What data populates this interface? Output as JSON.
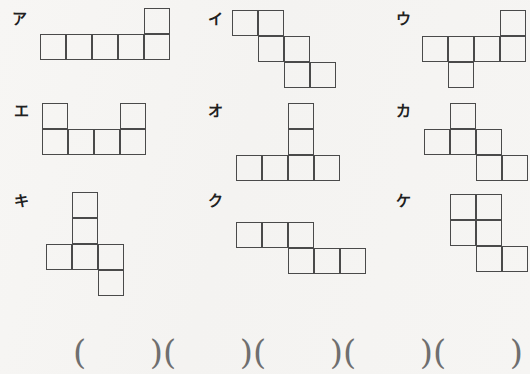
{
  "page": {
    "background_color": "#f6f5f3",
    "ink_color": "#4a4a4a",
    "label_color": "#202020",
    "paren_color": "#6f6f6f",
    "cell_size": 26
  },
  "shapes": [
    {
      "id": "shape-a",
      "label": "ア",
      "label_x": 12,
      "label_y": 12,
      "net_x": 40,
      "net_y": 8,
      "cells": [
        {
          "col": 4,
          "row": 0
        },
        {
          "col": 0,
          "row": 1
        },
        {
          "col": 1,
          "row": 1
        },
        {
          "col": 2,
          "row": 1
        },
        {
          "col": 3,
          "row": 1
        },
        {
          "col": 4,
          "row": 1
        }
      ]
    },
    {
      "id": "shape-i",
      "label": "イ",
      "label_x": 208,
      "label_y": 12,
      "net_x": 232,
      "net_y": 10,
      "cells": [
        {
          "col": 0,
          "row": 0
        },
        {
          "col": 1,
          "row": 0
        },
        {
          "col": 1,
          "row": 1
        },
        {
          "col": 2,
          "row": 1
        },
        {
          "col": 2,
          "row": 2
        },
        {
          "col": 3,
          "row": 2
        }
      ]
    },
    {
      "id": "shape-u",
      "label": "ウ",
      "label_x": 396,
      "label_y": 12,
      "net_x": 422,
      "net_y": 10,
      "cells": [
        {
          "col": 3,
          "row": 0
        },
        {
          "col": 0,
          "row": 1
        },
        {
          "col": 1,
          "row": 1
        },
        {
          "col": 2,
          "row": 1
        },
        {
          "col": 3,
          "row": 1
        },
        {
          "col": 1,
          "row": 2
        }
      ]
    },
    {
      "id": "shape-e",
      "label": "エ",
      "label_x": 14,
      "label_y": 104,
      "net_x": 42,
      "net_y": 103,
      "cells": [
        {
          "col": 0,
          "row": 0
        },
        {
          "col": 3,
          "row": 0
        },
        {
          "col": 0,
          "row": 1
        },
        {
          "col": 1,
          "row": 1
        },
        {
          "col": 2,
          "row": 1
        },
        {
          "col": 3,
          "row": 1
        }
      ]
    },
    {
      "id": "shape-o",
      "label": "オ",
      "label_x": 208,
      "label_y": 104,
      "net_x": 236,
      "net_y": 103,
      "cells": [
        {
          "col": 2,
          "row": 0
        },
        {
          "col": 2,
          "row": 1
        },
        {
          "col": 0,
          "row": 2
        },
        {
          "col": 1,
          "row": 2
        },
        {
          "col": 2,
          "row": 2
        },
        {
          "col": 3,
          "row": 2
        }
      ]
    },
    {
      "id": "shape-ka",
      "label": "カ",
      "label_x": 396,
      "label_y": 104,
      "net_x": 424,
      "net_y": 103,
      "cells": [
        {
          "col": 1,
          "row": 0
        },
        {
          "col": 0,
          "row": 1
        },
        {
          "col": 1,
          "row": 1
        },
        {
          "col": 2,
          "row": 1
        },
        {
          "col": 2,
          "row": 2
        },
        {
          "col": 3,
          "row": 2
        }
      ]
    },
    {
      "id": "shape-ki",
      "label": "キ",
      "label_x": 14,
      "label_y": 194,
      "net_x": 46,
      "net_y": 192,
      "cells": [
        {
          "col": 1,
          "row": 0
        },
        {
          "col": 1,
          "row": 1
        },
        {
          "col": 0,
          "row": 2
        },
        {
          "col": 1,
          "row": 2
        },
        {
          "col": 2,
          "row": 2
        },
        {
          "col": 2,
          "row": 3
        }
      ]
    },
    {
      "id": "shape-ku",
      "label": "ク",
      "label_x": 208,
      "label_y": 194,
      "net_x": 236,
      "net_y": 222,
      "cells": [
        {
          "col": 0,
          "row": 0
        },
        {
          "col": 1,
          "row": 0
        },
        {
          "col": 2,
          "row": 0
        },
        {
          "col": 2,
          "row": 1
        },
        {
          "col": 3,
          "row": 1
        },
        {
          "col": 4,
          "row": 1
        }
      ]
    },
    {
      "id": "shape-ke",
      "label": "ケ",
      "label_x": 396,
      "label_y": 194,
      "net_x": 450,
      "net_y": 194,
      "cells": [
        {
          "col": 0,
          "row": 0
        },
        {
          "col": 1,
          "row": 0
        },
        {
          "col": 0,
          "row": 1
        },
        {
          "col": 1,
          "row": 1
        },
        {
          "col": 1,
          "row": 2
        },
        {
          "col": 2,
          "row": 2
        }
      ]
    }
  ],
  "answers": {
    "open_paren": "(",
    "close_paren": ")",
    "slots": [
      {
        "id": "answer-slot-1",
        "value": "",
        "left": 73,
        "width": 90
      },
      {
        "id": "answer-slot-2",
        "value": "",
        "left": 163,
        "width": 90
      },
      {
        "id": "answer-slot-3",
        "value": "",
        "left": 253,
        "width": 90
      },
      {
        "id": "answer-slot-4",
        "value": "",
        "left": 343,
        "width": 90
      },
      {
        "id": "answer-slot-5",
        "value": "",
        "left": 433,
        "width": 90
      }
    ]
  }
}
